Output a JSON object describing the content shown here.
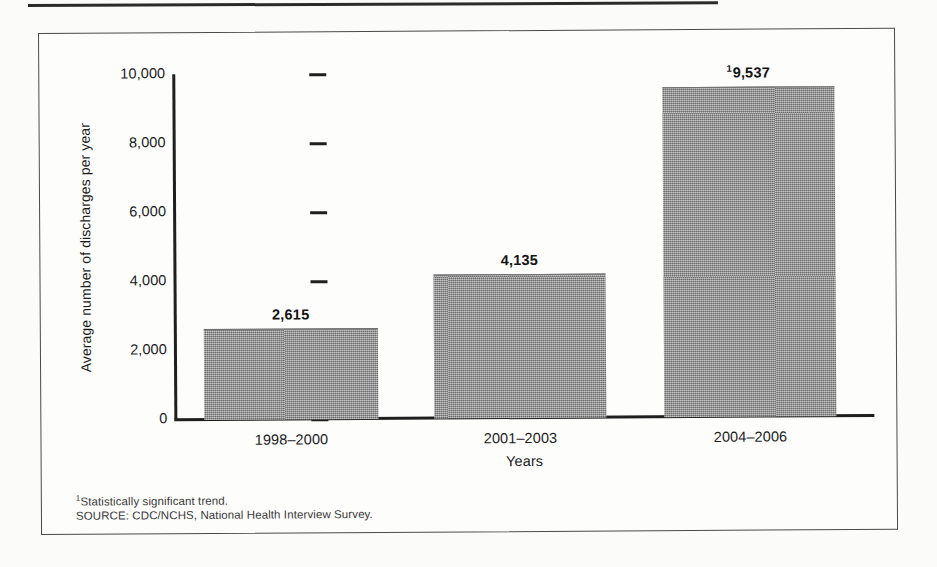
{
  "chart_data": {
    "type": "bar",
    "title": "",
    "subtitle": "",
    "xlabel": "Years",
    "ylabel": "Average number of discharges per year",
    "categories": [
      "1998–2000",
      "2001–2003",
      "2004–2006"
    ],
    "values": [
      2615,
      4135,
      9537
    ],
    "value_labels": [
      "2,615",
      "4,135",
      "9,537"
    ],
    "value_label_markers": [
      "",
      "",
      "1"
    ],
    "ylim": [
      0,
      10000
    ],
    "yticks": [
      0,
      2000,
      4000,
      6000,
      8000,
      10000
    ],
    "ytick_labels": [
      "0",
      "2,000",
      "4,000",
      "6,000",
      "8,000",
      "10,000"
    ],
    "grid": false,
    "legend": "none",
    "bar_color": "#8d8d8d",
    "axis_color": "#1f1f1f"
  },
  "footnotes": {
    "marker": "1",
    "trend_note": "Statistically significant trend.",
    "source": "SOURCE: CDC/NCHS, National Health Interview Survey."
  }
}
